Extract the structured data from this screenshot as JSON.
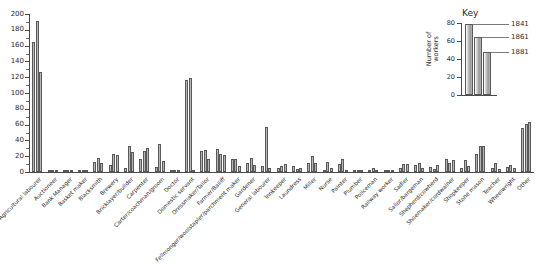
{
  "chart_data": {
    "type": "bar",
    "title": "",
    "xlabel": "",
    "ylabel": "",
    "ylim": [
      0,
      200
    ],
    "ytick_step": 20,
    "grid": false,
    "legend_position": "top-right",
    "categories": [
      "Agricultural labourer",
      "Auctioneer",
      "Bank Manager",
      "Basket maker",
      "Blacksmith",
      "Brewery",
      "Bricklayer/builder",
      "Carpenter",
      "Carter/coachman/groom",
      "Doctor",
      "Domestic servant",
      "Dressmaker/Tailor",
      "Farmer/Bailiff",
      "Fellmonger/woolstapler/parchment maker",
      "Gardener",
      "General labourer",
      "Innkeeper",
      "Laundress",
      "Miller",
      "Nurse",
      "Painter",
      "Plumber",
      "Policeman",
      "Railway worker",
      "Sadler",
      "Sailor/bargeman",
      "Shepherd/cowherd",
      "Shoemaker/cordwainer",
      "Shopkeeper",
      "Stone mason",
      "Teacher",
      "Wheelwright",
      "Other"
    ],
    "series": [
      {
        "name": "1841",
        "values": [
          165,
          1,
          0,
          2,
          13,
          9,
          5,
          16,
          6,
          1,
          117,
          26,
          29,
          16,
          11,
          7,
          5,
          8,
          12,
          0,
          10,
          1,
          2,
          0,
          5,
          9,
          6,
          16,
          5,
          23,
          5,
          6,
          56
        ]
      },
      {
        "name": "1861",
        "values": [
          191,
          2,
          1,
          3,
          18,
          23,
          33,
          27,
          35,
          2,
          119,
          28,
          23,
          17,
          18,
          57,
          8,
          4,
          20,
          13,
          17,
          3,
          5,
          2,
          10,
          12,
          4,
          11,
          15,
          33,
          11,
          9,
          61
        ]
      },
      {
        "name": "1881",
        "values": [
          126,
          1,
          0,
          1,
          11,
          22,
          25,
          30,
          14,
          2,
          0,
          17,
          21,
          7,
          9,
          5,
          10,
          5,
          11,
          5,
          3,
          2,
          1,
          1,
          10,
          5,
          9,
          15,
          7,
          33,
          4,
          5,
          63
        ]
      }
    ],
    "ytick_labels": [
      "0",
      "20",
      "40",
      "60",
      "80",
      "100",
      "120",
      "140",
      "160",
      "180",
      "200"
    ]
  },
  "key": {
    "title": "Key",
    "axis_title": "Number of workers",
    "ylim": [
      0,
      80
    ],
    "ytick_labels": [
      "0",
      "20",
      "40",
      "60",
      "80"
    ],
    "series": [
      {
        "label": "1841",
        "value": 79
      },
      {
        "label": "1861",
        "value": 64
      },
      {
        "label": "1881",
        "value": 48
      }
    ]
  },
  "colors": {
    "bar_fill_light": "#c9c9c9",
    "bar_fill_dark": "#9a9a9a",
    "bar_stroke": "#5a5a5a",
    "axis": "#4a4a4a",
    "text": "#2b2b2b",
    "background": "#ffffff"
  }
}
